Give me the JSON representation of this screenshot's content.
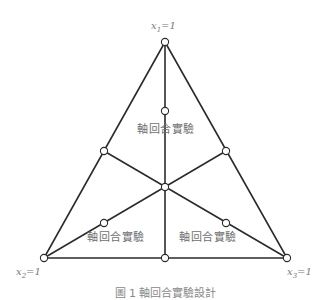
{
  "diagram": {
    "type": "ternary-axial-mixture-design",
    "colors": {
      "line": "#2b2b2b",
      "label": "#7a7a7a",
      "point_fill": "#ffffff"
    },
    "vertices": [
      {
        "id": "x1",
        "var": "x",
        "sub": "1",
        "eq": "=1",
        "pos": [
          165,
          42
        ]
      },
      {
        "id": "x2",
        "var": "x",
        "sub": "2",
        "eq": "=1",
        "pos": [
          44,
          258
        ]
      },
      {
        "id": "x3",
        "var": "x",
        "sub": "3",
        "eq": "=1",
        "pos": [
          287,
          258
        ]
      }
    ],
    "points": [
      {
        "id": "vertex-top",
        "pos": [
          165,
          42
        ]
      },
      {
        "id": "vertex-left",
        "pos": [
          44,
          258
        ]
      },
      {
        "id": "vertex-right",
        "pos": [
          287,
          258
        ]
      },
      {
        "id": "edge-mid-left",
        "pos": [
          104,
          151
        ]
      },
      {
        "id": "edge-mid-right",
        "pos": [
          226,
          151
        ]
      },
      {
        "id": "edge-mid-bottom",
        "pos": [
          165,
          258
        ]
      },
      {
        "id": "centroid",
        "pos": [
          165,
          187
        ]
      },
      {
        "id": "axial-top",
        "pos": [
          165,
          111
        ]
      },
      {
        "id": "axial-left",
        "pos": [
          104,
          223
        ]
      },
      {
        "id": "axial-right",
        "pos": [
          226,
          223
        ]
      }
    ],
    "region_labels": [
      {
        "text": "軸回合實驗",
        "pos": [
          137,
          127
        ]
      },
      {
        "text": "軸回合實驗",
        "pos": [
          87,
          233
        ]
      },
      {
        "text": "軸回合實驗",
        "pos": [
          179,
          233
        ]
      }
    ],
    "caption": "圖 1 軸回合實驗設計"
  }
}
